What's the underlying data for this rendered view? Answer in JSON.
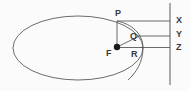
{
  "figure": {
    "kind": "geometry-diagram",
    "canvas": {
      "width": 190,
      "height": 91,
      "background": "#fbfbfb"
    },
    "stroke_color": "#555555",
    "label_color": "#3a3a3a",
    "ellipse": {
      "center_x": 78,
      "center_y": 48,
      "radius_x": 65,
      "radius_y": 32
    },
    "focus": {
      "label": "F",
      "x": 117,
      "y": 47,
      "dot_radius": 3.2,
      "label_x": 106,
      "label_y": 49
    },
    "curve_points": [
      {
        "label": "P",
        "x": 117,
        "y": 21,
        "label_x": 115,
        "label_y": 9
      },
      {
        "label": "Q",
        "x": 139,
        "y": 36,
        "label_x": 130,
        "label_y": 32
      },
      {
        "label": "R",
        "x": 143,
        "y": 48,
        "label_x": 131,
        "label_y": 50
      }
    ],
    "directrix": {
      "x": 170,
      "y_top": 3,
      "y_bottom": 85
    },
    "directrix_points": [
      {
        "label": "X",
        "from": "P",
        "y": 21,
        "label_x": 176,
        "label_y": 16
      },
      {
        "label": "Y",
        "from": "Q",
        "y": 36,
        "label_x": 176,
        "label_y": 30
      },
      {
        "label": "Z",
        "from": "R",
        "y": 48,
        "label_x": 176,
        "label_y": 43
      }
    ],
    "segments": [
      {
        "name": "focus-to-p",
        "x1": 117,
        "y1": 47,
        "x2": 117,
        "y2": 21
      },
      {
        "name": "focus-to-q",
        "x1": 117,
        "y1": 47,
        "x2": 139,
        "y2": 36
      },
      {
        "name": "focus-to-r",
        "x1": 117,
        "y1": 47,
        "x2": 143,
        "y2": 48
      },
      {
        "name": "p-to-x",
        "x1": 117,
        "y1": 21,
        "x2": 170,
        "y2": 21
      },
      {
        "name": "q-to-y",
        "x1": 139,
        "y1": 36,
        "x2": 170,
        "y2": 36
      },
      {
        "name": "r-to-z",
        "x1": 143,
        "y1": 48,
        "x2": 170,
        "y2": 48
      }
    ],
    "inner_arc": {
      "note": "arc through P, Q, R centered near focus",
      "start_x": 117,
      "start_y": 21,
      "end_x": 128,
      "end_y": 80
    }
  }
}
